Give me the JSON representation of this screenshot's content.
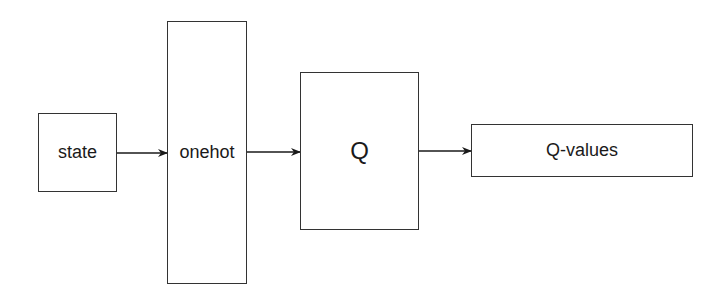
{
  "diagram": {
    "nodes": [
      {
        "id": "state",
        "label": "state"
      },
      {
        "id": "onehot",
        "label": "onehot"
      },
      {
        "id": "q",
        "label": "Q"
      },
      {
        "id": "qvalues",
        "label": "Q-values"
      }
    ],
    "edges": [
      {
        "from": "state",
        "to": "onehot"
      },
      {
        "from": "onehot",
        "to": "q"
      },
      {
        "from": "q",
        "to": "qvalues"
      }
    ],
    "colors": {
      "stroke": "#333333",
      "background": "#ffffff"
    }
  }
}
